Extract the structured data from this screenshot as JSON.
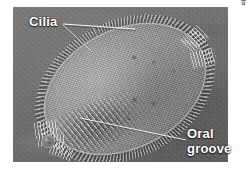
{
  "figure": {
    "type": "light-micrograph",
    "labels": {
      "cilia": "Cilia",
      "oral_groove_line1": "Oral",
      "oral_groove_line2": "groove"
    },
    "credit": "LM 200×",
    "colors": {
      "label_text": "#ffffff",
      "leader_line": "#ffffff",
      "field_background": "#6f6f6f",
      "cell_body": "#9e9e9e",
      "page_background": "#ffffff",
      "credit_text": "#555555"
    },
    "icon_names": {
      "cilia_leader": "leader-line-icon",
      "oral_leader": "leader-line-icon"
    }
  }
}
